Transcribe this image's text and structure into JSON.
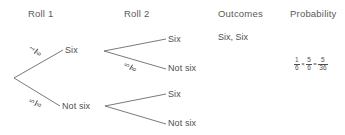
{
  "headers": {
    "roll1": "Roll 1",
    "roll2": "Roll 2",
    "outcomes": "Outcomes",
    "probability": "Probability"
  },
  "tree": {
    "level1": [
      {
        "label": "Six",
        "prob_num": "1",
        "prob_den": "6"
      },
      {
        "label": "Not six",
        "prob_num": "5",
        "prob_den": "6"
      }
    ],
    "level2_upper": [
      {
        "label": "Six",
        "prob_num": "",
        "prob_den": ""
      },
      {
        "label": "Not six",
        "prob_num": "5",
        "prob_den": "6"
      }
    ],
    "level2_lower": [
      {
        "label": "Six",
        "prob_num": "",
        "prob_den": ""
      },
      {
        "label": "Not six",
        "prob_num": "",
        "prob_den": ""
      }
    ]
  },
  "outcomes": [
    {
      "text": "Six, Six"
    }
  ],
  "probability_expression": {
    "factor1": {
      "num": "1",
      "den": "6"
    },
    "times": "×",
    "factor2": {
      "num": "5",
      "den": "6"
    },
    "equals": "=",
    "result": {
      "num": "5",
      "den": "36"
    }
  },
  "colors": {
    "line": "#6b6b6b",
    "text": "#4f4f4f",
    "background": "#ffffff"
  }
}
